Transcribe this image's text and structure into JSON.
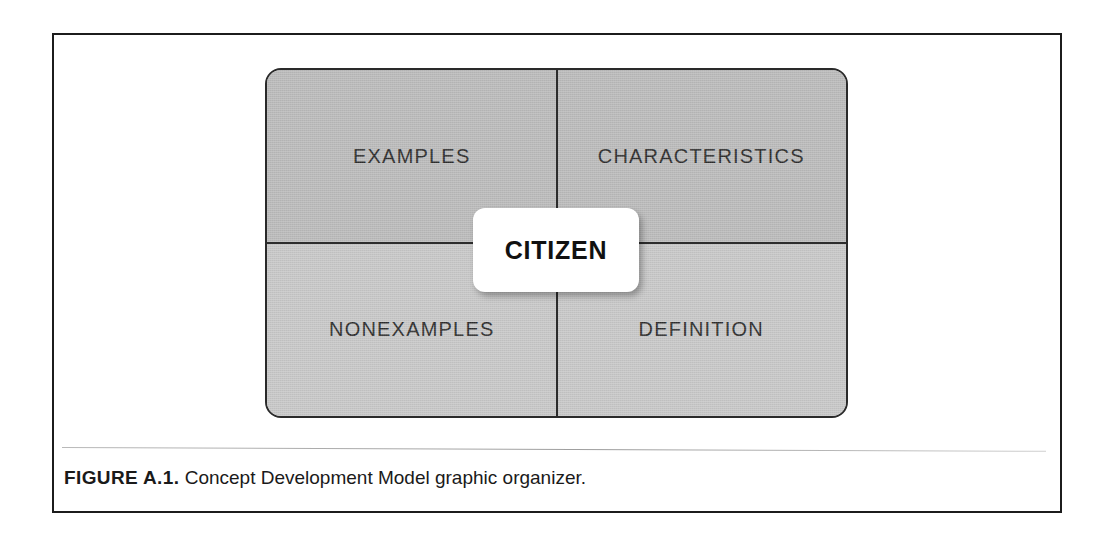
{
  "figure": {
    "caption_label": "FIGURE A.1.",
    "caption_text": "Concept Development Model graphic organizer.",
    "organizer": {
      "center_concept": "CITIZEN",
      "quadrants": [
        {
          "id": "examples",
          "label": "EXAMPLES",
          "position": "top-left",
          "fill": "#bcbcbc"
        },
        {
          "id": "characteristics",
          "label": "CHARACTERISTICS",
          "position": "top-right",
          "fill": "#bcbcbc"
        },
        {
          "id": "nonexamples",
          "label": "NONEXAMPLES",
          "position": "bottom-left",
          "fill": "#c9c9c9"
        },
        {
          "id": "definition",
          "label": "DEFINITION",
          "position": "bottom-right",
          "fill": "#c9c9c9"
        }
      ]
    }
  },
  "colors": {
    "page_background": "#ffffff",
    "page_border": "#1c1c1c",
    "organizer_border": "#2a2a2a",
    "divider": "#2c2c2c",
    "center_card_background": "#ffffff",
    "text": "#2d2d2d",
    "caption_text": "#1a1a1a",
    "caption_rule": "#9d9d9d"
  }
}
